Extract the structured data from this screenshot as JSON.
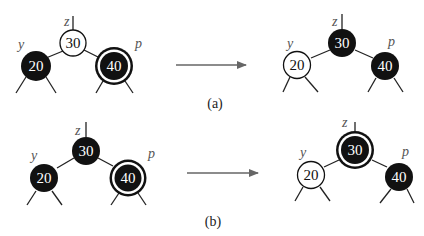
{
  "diagram": {
    "colors": {
      "black": "#111111",
      "white": "#ffffff",
      "edge": "#222222",
      "arrow": "#666666",
      "label": "#555555"
    },
    "panels": [
      {
        "caption": "(a)",
        "before": {
          "nodes": [
            {
              "role": "z",
              "key": "30",
              "color": "white",
              "double_black": false
            },
            {
              "role": "y",
              "key": "20",
              "color": "black",
              "double_black": false
            },
            {
              "role": "p",
              "key": "40",
              "color": "black",
              "double_black": true
            }
          ]
        },
        "after": {
          "nodes": [
            {
              "role": "z",
              "key": "30",
              "color": "black",
              "double_black": false
            },
            {
              "role": "y",
              "key": "20",
              "color": "white",
              "double_black": false
            },
            {
              "role": "p",
              "key": "40",
              "color": "black",
              "double_black": false
            }
          ]
        }
      },
      {
        "caption": "(b)",
        "before": {
          "nodes": [
            {
              "role": "z",
              "key": "30",
              "color": "black",
              "double_black": false
            },
            {
              "role": "y",
              "key": "20",
              "color": "black",
              "double_black": false
            },
            {
              "role": "p",
              "key": "40",
              "color": "black",
              "double_black": true
            }
          ]
        },
        "after": {
          "nodes": [
            {
              "role": "z",
              "key": "30",
              "color": "black",
              "double_black": true
            },
            {
              "role": "y",
              "key": "20",
              "color": "white",
              "double_black": false
            },
            {
              "role": "p",
              "key": "40",
              "color": "black",
              "double_black": false
            }
          ]
        }
      }
    ]
  },
  "labels": {
    "a_before": {
      "z": "z",
      "y": "y",
      "p": "p",
      "z_key": "30",
      "y_key": "20",
      "p_key": "40"
    },
    "a_after": {
      "z": "z",
      "y": "y",
      "p": "p",
      "z_key": "30",
      "y_key": "20",
      "p_key": "40"
    },
    "b_before": {
      "z": "z",
      "y": "y",
      "p": "p",
      "z_key": "30",
      "y_key": "20",
      "p_key": "40"
    },
    "b_after": {
      "z": "z",
      "y": "y",
      "p": "p",
      "z_key": "30",
      "y_key": "20",
      "p_key": "40"
    },
    "caption_a": "(a)",
    "caption_b": "(b)"
  }
}
